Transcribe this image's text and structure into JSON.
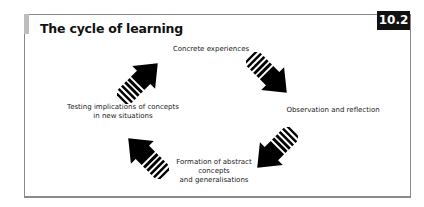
{
  "figure": {
    "title": "The cycle of learning",
    "badge": "10.2",
    "accent_color": "#bdbdbd",
    "border_color": "#8a8a8a"
  },
  "cycle": {
    "stages": [
      {
        "label": "Concrete experiences",
        "position": "top"
      },
      {
        "label": "Observation and reflection",
        "position": "right"
      },
      {
        "label_lines": [
          "Formation of abstract",
          "concepts",
          "and generalisations"
        ],
        "position": "bottom"
      },
      {
        "label_lines": [
          "Testing implications of concepts",
          "in new situations"
        ],
        "position": "left"
      }
    ],
    "arrows": [
      {
        "name": "arrow-to-concrete-experiences",
        "direction": "north-east"
      },
      {
        "name": "arrow-to-observation",
        "direction": "south-east"
      },
      {
        "name": "arrow-to-formation",
        "direction": "south-west"
      },
      {
        "name": "arrow-to-testing",
        "direction": "north-west"
      }
    ]
  }
}
